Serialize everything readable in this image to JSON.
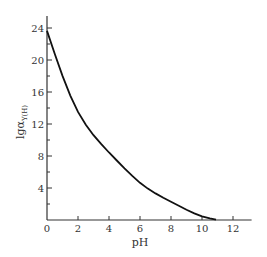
{
  "chart_data": {
    "type": "line",
    "title": "",
    "xlabel": "pH",
    "ylabel": "lgα",
    "ylabel_subscript": "Y(H)",
    "xlim": [
      0,
      13.2
    ],
    "ylim": [
      0,
      25.5
    ],
    "x_ticks": [
      0,
      2,
      4,
      6,
      8,
      10,
      12
    ],
    "x_tick_labels": [
      "0",
      "2",
      "4",
      "6",
      "8",
      "10",
      "12"
    ],
    "y_ticks": [
      4,
      8,
      12,
      16,
      20,
      24
    ],
    "y_tick_labels": [
      "4",
      "8",
      "12",
      "16",
      "20",
      "24"
    ],
    "y_minor_ticks": [
      2,
      6,
      10,
      14,
      18,
      22
    ],
    "grid": false,
    "legend": null,
    "series": [
      {
        "name": "lgαY(H)",
        "x": [
          0,
          0.5,
          1,
          1.5,
          2,
          2.5,
          3,
          3.5,
          4,
          4.5,
          5,
          5.5,
          6,
          6.5,
          7,
          7.5,
          8,
          8.5,
          9,
          9.5,
          10,
          10.5,
          10.9
        ],
        "values": [
          23.64,
          20.75,
          18.01,
          15.55,
          13.51,
          11.9,
          10.6,
          9.48,
          8.44,
          7.44,
          6.45,
          5.51,
          4.65,
          3.92,
          3.32,
          2.78,
          2.27,
          1.77,
          1.28,
          0.83,
          0.45,
          0.2,
          0.05
        ]
      }
    ]
  }
}
